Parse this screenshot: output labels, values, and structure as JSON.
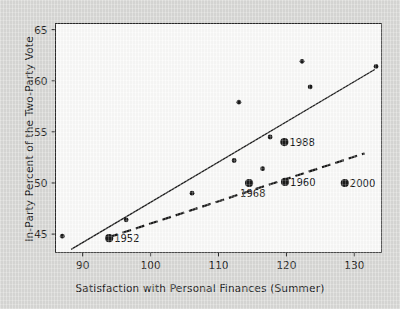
{
  "chart_data": {
    "type": "scatter",
    "title": "",
    "xlabel": "Satisfaction with Personal Finances (Summer)",
    "ylabel": "In-Party Percent of the Two-Party Vote",
    "xlim": [
      86,
      134
    ],
    "ylim": [
      43.2,
      65.6
    ],
    "xticks": [
      90,
      100,
      110,
      120,
      130
    ],
    "yticks": [
      45,
      50,
      55,
      60,
      65
    ],
    "grid": false,
    "legend": "none",
    "points": [
      {
        "x": 87.0,
        "y": 44.8,
        "label": "",
        "emphasis": false
      },
      {
        "x": 93.9,
        "y": 44.6,
        "label": "1952",
        "emphasis": true,
        "label_side": "right"
      },
      {
        "x": 96.4,
        "y": 46.4,
        "label": "",
        "emphasis": false
      },
      {
        "x": 106.1,
        "y": 49.0,
        "label": "",
        "emphasis": false
      },
      {
        "x": 112.3,
        "y": 52.2,
        "label": "",
        "emphasis": false
      },
      {
        "x": 113.0,
        "y": 57.9,
        "label": "",
        "emphasis": false
      },
      {
        "x": 114.5,
        "y": 50.0,
        "label": "1968",
        "emphasis": true,
        "label_side": "below"
      },
      {
        "x": 116.5,
        "y": 51.4,
        "label": "",
        "emphasis": false
      },
      {
        "x": 117.6,
        "y": 54.5,
        "label": "",
        "emphasis": false
      },
      {
        "x": 119.7,
        "y": 54.0,
        "label": "1988",
        "emphasis": true,
        "label_side": "right"
      },
      {
        "x": 119.8,
        "y": 50.1,
        "label": "1960",
        "emphasis": true,
        "label_side": "right"
      },
      {
        "x": 122.3,
        "y": 61.9,
        "label": "",
        "emphasis": false
      },
      {
        "x": 123.5,
        "y": 59.4,
        "label": "",
        "emphasis": false
      },
      {
        "x": 128.6,
        "y": 50.0,
        "label": "2000",
        "emphasis": true,
        "label_side": "right"
      },
      {
        "x": 133.2,
        "y": 61.4,
        "label": "",
        "emphasis": false
      }
    ],
    "lines": [
      {
        "name": "solid-regression-line",
        "style": "solid",
        "x1": 88.3,
        "y1": 43.5,
        "x2": 133.0,
        "y2": 61.1
      },
      {
        "name": "dashed-regression-line",
        "style": "dashed",
        "x1": 93.9,
        "y1": 44.7,
        "x2": 131.5,
        "y2": 52.9
      }
    ],
    "point_colors": {
      "marker": "#1a1a1a",
      "line": "#1a1a1a"
    }
  },
  "axes": {
    "x_title": "Satisfaction with Personal Finances (Summer)",
    "y_title": "In-Party Percent of the Two-Party Vote",
    "x_tick_labels": [
      "90",
      "100",
      "110",
      "120",
      "130"
    ],
    "y_tick_labels": [
      "45",
      "50",
      "55",
      "60",
      "65"
    ]
  },
  "annotations": [
    {
      "text": "1952"
    },
    {
      "text": "1968"
    },
    {
      "text": "1988"
    },
    {
      "text": "1960"
    },
    {
      "text": "2000"
    }
  ],
  "colors": {
    "background": "#d9d9d7",
    "plot_area": "#fbfbfa",
    "ink": "#1a1a1a"
  }
}
